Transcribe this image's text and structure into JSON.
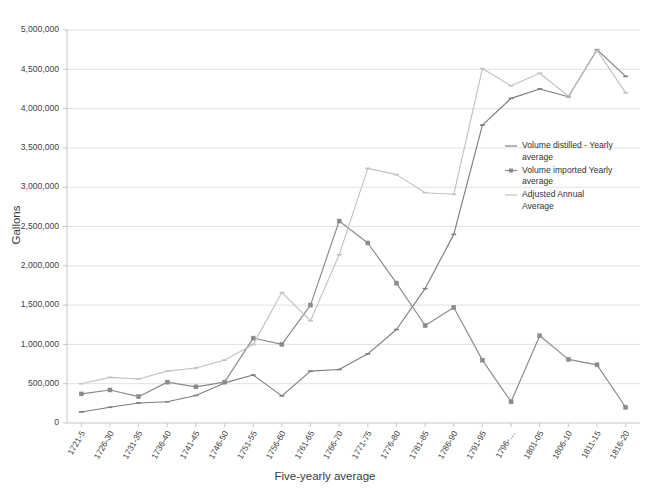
{
  "chart_data": {
    "type": "line",
    "title": "",
    "xlabel": "Five-yearly average",
    "ylabel": "Gallons",
    "ylim": [
      0,
      5000000
    ],
    "ytick_values": [
      0,
      500000,
      1000000,
      1500000,
      2000000,
      2500000,
      3000000,
      3500000,
      4000000,
      4500000,
      5000000
    ],
    "ytick_labels": [
      "0",
      "500,000",
      "1,000,000",
      "1,500,000",
      "2,000,000",
      "2,500,000",
      "3,000,000",
      "3,500,000",
      "4,000,000",
      "4,500,000",
      "5,000,000"
    ],
    "grid": true,
    "legend_position": "right-middle",
    "categories": [
      "1721-5",
      "1726-30",
      "1731-35",
      "1736-40",
      "1741-45",
      "1746-50",
      "1751-55",
      "1756-60",
      "1761-65",
      "1766-70",
      "1771-75",
      "1776-80",
      "1781-85",
      "1786-90",
      "1791-95",
      "1796-…",
      "1801-05",
      "1806-10",
      "1811-15",
      "1816-20"
    ],
    "series": [
      {
        "name": "Volume distilled - Yearly average",
        "color": "#7d7d7d",
        "marker": "dash",
        "values": [
          140000,
          200000,
          255000,
          270000,
          350000,
          510000,
          610000,
          345000,
          660000,
          680000,
          880000,
          1190000,
          1710000,
          2400000,
          3790000,
          4130000,
          4250000,
          4150000,
          4750000,
          4410000
        ]
      },
      {
        "name": "Volume imported Yearly average",
        "color": "#8a8a8a",
        "marker": "square",
        "values": [
          370000,
          420000,
          335000,
          520000,
          460000,
          520000,
          1080000,
          1000000,
          1500000,
          2570000,
          2290000,
          1780000,
          1240000,
          1470000,
          800000,
          270000,
          1110000,
          810000,
          740000,
          200000
        ]
      },
      {
        "name": "Adjusted Annual Average",
        "color": "#c2c2c2",
        "marker": "dash",
        "values": [
          500000,
          580000,
          560000,
          660000,
          700000,
          800000,
          1000000,
          1660000,
          1300000,
          2140000,
          3240000,
          3160000,
          2930000,
          2910000,
          4510000,
          4290000,
          4450000,
          4160000,
          4740000,
          4200000
        ]
      }
    ],
    "legend_entries": [
      {
        "label_line1": "Volume distilled - Yearly",
        "label_line2": "average",
        "color": "#7d7d7d"
      },
      {
        "label_line1": "Volume imported Yearly",
        "label_line2": "average",
        "color": "#8a8a8a"
      },
      {
        "label_line1": "Adjusted Annual",
        "label_line2": "Average",
        "color": "#c2c2c2"
      }
    ]
  }
}
